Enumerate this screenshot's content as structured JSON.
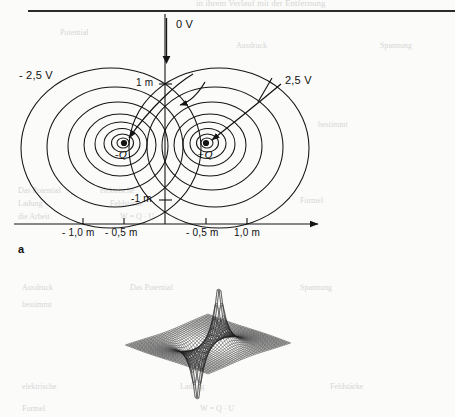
{
  "page": {
    "background_color": "#fbfbfa",
    "ink_color": "#141414",
    "ghost_header": "in ihrem Verlauf mit der Entfernung",
    "ghost_words": [
      "Ausdruck",
      "Potential",
      "Feldstärke",
      "Spannung",
      "bestimmt",
      "Ladung",
      "die Arbeit",
      "W = Q · U",
      "Das Potential",
      "elektrische",
      "Formel"
    ]
  },
  "figure_a": {
    "label": "a",
    "caption_kind": "equipotential-lines",
    "axis": {
      "y_top_label": "0 V",
      "y_ticks": [
        "1 m",
        "-1 m"
      ],
      "x_ticks_left": [
        "- 1,0 m",
        "- 0,5 m"
      ],
      "x_ticks_right": [
        "- 0,5 m",
        "1,0 m"
      ],
      "x_arrow": true,
      "y_arrow": true
    },
    "annotations": {
      "left_potential": "- 2,5 V",
      "right_potential": "2,5 V",
      "negative_charge": "-Q",
      "positive_charge": "+Q"
    }
  },
  "figure_b": {
    "label": "b",
    "caption_kind": "potential-surface-mesh",
    "description": "3D wireframe mesh of dipole potential: positive peak right-of-centre, negative well left-of-centre"
  },
  "chart_data": {
    "type": "line",
    "xlabel": "x",
    "ylabel": "y",
    "xlim": [
      -1.6,
      1.6
    ],
    "ylim": [
      -1.6,
      1.6
    ],
    "grid": false,
    "legend": "none",
    "charges": [
      {
        "name": "-Q",
        "x": -0.5,
        "y": 0.0,
        "sign": -1
      },
      {
        "name": "+Q",
        "x": 0.5,
        "y": 0.0,
        "sign": 1
      }
    ],
    "contour_levels_volts": [
      -2.5,
      -3.5,
      -5,
      -7.5,
      -12,
      -20,
      -40,
      2.5,
      3.5,
      5,
      7.5,
      12,
      20,
      40
    ],
    "annotated_levels": [
      {
        "label": "- 2,5 V",
        "value": -2.5
      },
      {
        "label": "2,5 V",
        "value": 2.5
      },
      {
        "label": "0 V",
        "value": 0.0,
        "note": "plane of symmetry on y-axis"
      }
    ],
    "x_tick_values": [
      -1.0,
      -0.5,
      0.5,
      1.0
    ],
    "x_tick_labels": [
      "- 1,0 m",
      "- 0,5 m",
      "- 0,5 m",
      "1,0 m"
    ],
    "y_tick_values": [
      1.0,
      -1.0
    ],
    "y_tick_labels": [
      "1 m",
      "-1 m"
    ]
  }
}
